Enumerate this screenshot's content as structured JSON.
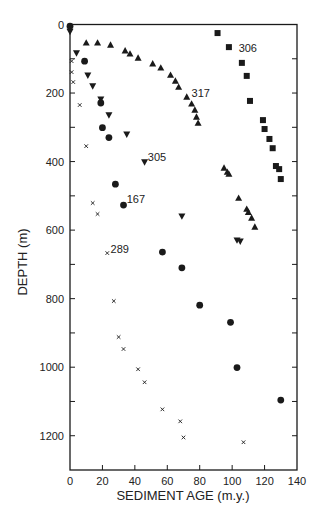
{
  "chart_data": {
    "type": "scatter",
    "title": "",
    "xlabel": "SEDIMENT AGE (m.y.)",
    "ylabel": "DEPTH (m)",
    "xlim": [
      0,
      140
    ],
    "ylim": [
      1300,
      0
    ],
    "y_inverted": true,
    "grid": false,
    "legend": "none (series labeled inline)",
    "x_ticks": [
      0,
      20,
      40,
      60,
      80,
      100,
      120,
      140
    ],
    "y_ticks": [
      0,
      200,
      400,
      600,
      800,
      1000,
      1200
    ],
    "y_minor_ticks": [
      100,
      300,
      500,
      700,
      900,
      1100
    ],
    "series": [
      {
        "name": "306",
        "marker": "square",
        "label_pos": {
          "age": 104,
          "depth": 70
        },
        "x": [
          91,
          98,
          106,
          109,
          111,
          119,
          120,
          123,
          125,
          127,
          129,
          130
        ],
        "y": [
          25,
          66,
          112,
          150,
          223,
          279,
          305,
          334,
          361,
          413,
          422,
          451
        ]
      },
      {
        "name": "317",
        "marker": "triangle-up",
        "label_pos": {
          "age": 75,
          "depth": 200
        },
        "x": [
          10,
          17,
          25,
          34,
          37,
          42,
          51,
          56,
          62,
          65,
          67,
          72,
          75,
          77,
          78,
          79,
          95,
          97,
          98,
          104,
          109,
          110,
          112,
          114
        ],
        "y": [
          54,
          54,
          60,
          77,
          86,
          98,
          115,
          127,
          148,
          165,
          183,
          212,
          232,
          250,
          270,
          288,
          419,
          431,
          437,
          507,
          539,
          548,
          565,
          591
        ]
      },
      {
        "name": "305",
        "marker": "triangle-down",
        "label_pos": {
          "age": 48,
          "depth": 388
        },
        "x": [
          0,
          4,
          11,
          14,
          19,
          24,
          35,
          46,
          69,
          103,
          105
        ],
        "y": [
          20,
          83,
          148,
          179,
          218,
          264,
          320,
          401,
          559,
          629,
          632
        ]
      },
      {
        "name": "167",
        "marker": "circle",
        "label_pos": {
          "age": 35,
          "depth": 510
        },
        "x": [
          0,
          9,
          19,
          20,
          24,
          28,
          33,
          57,
          69,
          80,
          99,
          103,
          130
        ],
        "y": [
          5,
          107,
          229,
          301,
          330,
          466,
          527,
          664,
          710,
          819,
          869,
          1001,
          1096
        ]
      },
      {
        "name": "289",
        "marker": "cross",
        "label_pos": {
          "age": 25,
          "depth": 655
        },
        "x": [
          1,
          1,
          2,
          6,
          10,
          14,
          17,
          23,
          27,
          30,
          33,
          42,
          46,
          57,
          68,
          70,
          107
        ],
        "y": [
          107,
          139,
          168,
          235,
          355,
          521,
          553,
          667,
          807,
          912,
          947,
          1006,
          1044,
          1123,
          1158,
          1205,
          1219
        ]
      }
    ]
  },
  "colors": {
    "ink": "#1a1a1a",
    "background": "#ffffff"
  }
}
